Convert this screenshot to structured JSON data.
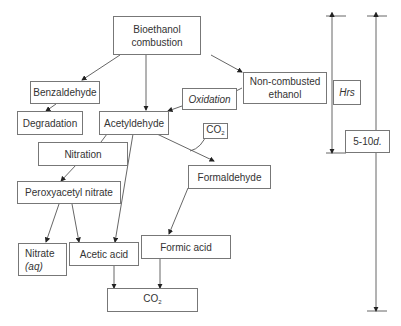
{
  "diagram": {
    "nodes": {
      "bioethanol": {
        "line1": "Bioethanol",
        "line2": "combustion"
      },
      "benzaldehyde": "Benzaldehyde",
      "degradation": "Degradation",
      "acetyldehyde": "Acetyldehyde",
      "non_combusted": {
        "line1": "Non-combusted",
        "line2": "ethanol"
      },
      "oxidation": "Oxidation",
      "co2_small": {
        "main": "CO",
        "sub": "2"
      },
      "nitration": "Nitration",
      "pan": "Peroxyacetyl nitrate",
      "formaldehyde": "Formaldehyde",
      "nitrate": {
        "line1": "Nitrate",
        "line2": "(aq)"
      },
      "acetic_acid": "Acetic acid",
      "formic_acid": "Formic acid",
      "co2_final": {
        "main": "CO",
        "sub": "2"
      }
    },
    "timescales": {
      "short": {
        "label": "Hrs"
      },
      "long": {
        "label_num": "5-10",
        "label_unit": "d."
      }
    },
    "edges": [
      {
        "from": "bioethanol",
        "to": "benzaldehyde"
      },
      {
        "from": "bioethanol",
        "to": "acetyldehyde"
      },
      {
        "from": "bioethanol",
        "to": "non_combusted"
      },
      {
        "from": "benzaldehyde",
        "to": "degradation"
      },
      {
        "from": "non_combusted",
        "to": "acetyldehyde",
        "label": "Oxidation"
      },
      {
        "from": "acetyldehyde",
        "to": "co2_small"
      },
      {
        "from": "acetyldehyde",
        "to": "formaldehyde"
      },
      {
        "from": "acetyldehyde",
        "to": "nitration"
      },
      {
        "from": "acetyldehyde",
        "to": "acetic_acid"
      },
      {
        "from": "nitration",
        "to": "pan"
      },
      {
        "from": "pan",
        "to": "nitrate"
      },
      {
        "from": "pan",
        "to": "acetic_acid"
      },
      {
        "from": "formaldehyde",
        "to": "formic_acid"
      },
      {
        "from": "acetic_acid",
        "to": "co2_final"
      },
      {
        "from": "formic_acid",
        "to": "co2_final"
      }
    ]
  }
}
